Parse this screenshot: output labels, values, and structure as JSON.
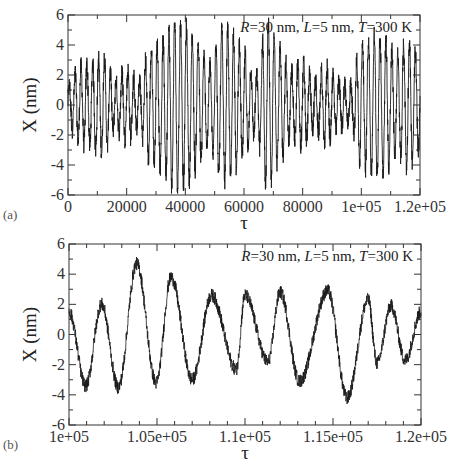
{
  "chart_data": [
    {
      "panel_label": "(a)",
      "type": "line",
      "title": "",
      "annotation": {
        "R": "30",
        "L": "5",
        "T": "300",
        "text_parts": [
          "R",
          "=30 nm, ",
          "L",
          "=5 nm, ",
          "T",
          "=300 K"
        ]
      },
      "xlabel": "τ",
      "ylabel": "X (nm)",
      "xlim": [
        0,
        120000
      ],
      "ylim": [
        -6,
        6
      ],
      "x_ticks": [
        0,
        20000,
        40000,
        60000,
        80000,
        100000,
        120000
      ],
      "x_tick_labels": [
        "0",
        "20000",
        "40000",
        "60000",
        "80000",
        "1e+05",
        "1.2e+05"
      ],
      "x_minor_step": 10000,
      "y_ticks": [
        -6,
        -4,
        -2,
        0,
        2,
        4,
        6
      ],
      "y_tick_labels": [
        "-6",
        "-4",
        "-2",
        "0",
        "2",
        "4",
        "6"
      ],
      "y_minor_step": 1,
      "grid": false,
      "legend": null,
      "series": [
        {
          "name": "X(τ)",
          "color": "#1a1a1a",
          "description": "Fast oscillation (period ≈ 2000 τ) with beating amplitude envelope",
          "oscillation_period": 2000,
          "envelope": {
            "x": [
              0,
              4000,
              8000,
              12000,
              16000,
              20000,
              24000,
              28000,
              32000,
              36000,
              40000,
              44000,
              48000,
              52000,
              56000,
              60000,
              64000,
              68000,
              72000,
              76000,
              80000,
              84000,
              88000,
              92000,
              96000,
              100000,
              104000,
              108000,
              112000,
              116000,
              120000
            ],
            "amplitude": [
              1.2,
              2.5,
              2.8,
              3.2,
              1.6,
              2.3,
              1.5,
              3.6,
              4.2,
              5.5,
              5.2,
              4.2,
              2.6,
              5.0,
              4.8,
              3.4,
              1.8,
              5.6,
              3.6,
              2.2,
              2.8,
              1.5,
              2.6,
              1.6,
              1.2,
              4.0,
              4.6,
              4.4,
              3.2,
              4.2,
              3.0
            ]
          },
          "extremes": {
            "max": 6.0,
            "max_at": 34000,
            "min": -5.8,
            "min_at": 37000
          }
        }
      ]
    },
    {
      "panel_label": "(b)",
      "type": "line",
      "title": "",
      "annotation": {
        "R": "30",
        "L": "5",
        "T": "300",
        "text_parts": [
          "R",
          "=30 nm, ",
          "L",
          "=5 nm, ",
          "T",
          "=300 K"
        ]
      },
      "xlabel": "τ",
      "ylabel": "X (nm)",
      "xlim": [
        100000,
        120000
      ],
      "ylim": [
        -6,
        6
      ],
      "x_ticks": [
        100000,
        105000,
        110000,
        115000,
        120000
      ],
      "x_tick_labels": [
        "1e+05",
        "1.05e+05",
        "1.1e+05",
        "1.15e+05",
        "1.2e+05"
      ],
      "x_minor_step": 1000,
      "y_ticks": [
        -6,
        -4,
        -2,
        0,
        2,
        4,
        6
      ],
      "y_tick_labels": [
        "-6",
        "-4",
        "-2",
        "0",
        "2",
        "4",
        "6"
      ],
      "y_minor_step": 1,
      "grid": false,
      "legend": null,
      "series": [
        {
          "name": "X(τ) zoom",
          "color": "#1a1a1a",
          "description": "Zoomed window of trace (a) between 1e5 and 1.2e5, noisy oscillation period ≈ 2000 τ",
          "x": [
            100000,
            100950,
            101850,
            102800,
            103850,
            104950,
            105800,
            107000,
            108100,
            109500,
            110000,
            111300,
            112000,
            113100,
            114700,
            115800,
            117000,
            117500,
            118300,
            119100,
            120000
          ],
          "y": [
            1.5,
            -3.4,
            2.0,
            -3.5,
            4.7,
            -3.2,
            3.8,
            -3.0,
            2.6,
            -2.3,
            2.6,
            -1.8,
            2.8,
            -3.1,
            2.9,
            -4.2,
            2.3,
            -1.9,
            1.9,
            -1.7,
            1.5
          ]
        }
      ]
    }
  ],
  "panels": {
    "a": {
      "tag": "(a)",
      "annotation_values": {
        "R": "=30 nm, ",
        "L": "=5 nm, ",
        "T": "=300 K"
      }
    },
    "b": {
      "tag": "(b)",
      "annotation_values": {
        "R": "=30 nm, ",
        "L": "=5 nm, ",
        "T": "=300 K"
      }
    }
  },
  "labels": {
    "x_axis": "τ",
    "y_axis": "X (nm)",
    "R": "R",
    "L": "L",
    "T": "T"
  }
}
